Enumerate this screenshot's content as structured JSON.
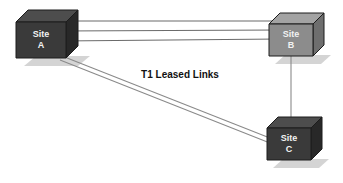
{
  "canvas": {
    "width": 343,
    "height": 183,
    "background_color": "#ffffff"
  },
  "diagram": {
    "type": "network-topology",
    "caption": "T1 Leased Links",
    "caption_position": {
      "x": 180,
      "y": 75
    },
    "palette": {
      "dark_cube_front": "#3a3a3a",
      "dark_cube_top": "#4d4d4d",
      "dark_cube_side": "#2a2a2a",
      "light_cube_front": "#8c8c8c",
      "light_cube_top": "#a3a3a3",
      "light_cube_side": "#6e6e6e",
      "cube_outline": "#1a1a1a",
      "shadow": "#c9c9c9",
      "link_line": "#6b6b6b",
      "label_text": "#f2f2f2",
      "caption_text": "#111111"
    },
    "nodes": [
      {
        "id": "site-a",
        "label_line1": "Site",
        "label_line2": "A",
        "shade": "dark",
        "x": 16,
        "y": 10,
        "width": 50,
        "height": 48,
        "depth": 12
      },
      {
        "id": "site-b",
        "label_line1": "Site",
        "label_line2": "B",
        "shade": "light",
        "x": 269,
        "y": 13,
        "width": 44,
        "height": 43,
        "depth": 11
      },
      {
        "id": "site-c",
        "label_line1": "Site",
        "label_line2": "C",
        "shade": "dark",
        "x": 267,
        "y": 117,
        "width": 44,
        "height": 43,
        "depth": 11
      }
    ],
    "links": [
      {
        "id": "link-a-b-1",
        "from": "site-a",
        "to": "site-b",
        "x1": 67,
        "y1": 21,
        "x2": 269,
        "y2": 21
      },
      {
        "id": "link-a-b-2",
        "from": "site-a",
        "to": "site-b",
        "x1": 67,
        "y1": 31,
        "x2": 269,
        "y2": 30
      },
      {
        "id": "link-a-b-3",
        "from": "site-a",
        "to": "site-b",
        "x1": 67,
        "y1": 41,
        "x2": 269,
        "y2": 39
      },
      {
        "id": "link-a-c-1",
        "from": "site-a",
        "to": "site-c",
        "x1": 64,
        "y1": 57,
        "x2": 267,
        "y2": 141
      },
      {
        "id": "link-a-c-2",
        "from": "site-a",
        "to": "site-c",
        "x1": 62,
        "y1": 61,
        "x2": 267,
        "y2": 146
      },
      {
        "id": "link-b-c-1",
        "from": "site-b",
        "to": "site-c",
        "x1": 291,
        "y1": 67,
        "x2": 291,
        "y2": 122
      }
    ]
  }
}
